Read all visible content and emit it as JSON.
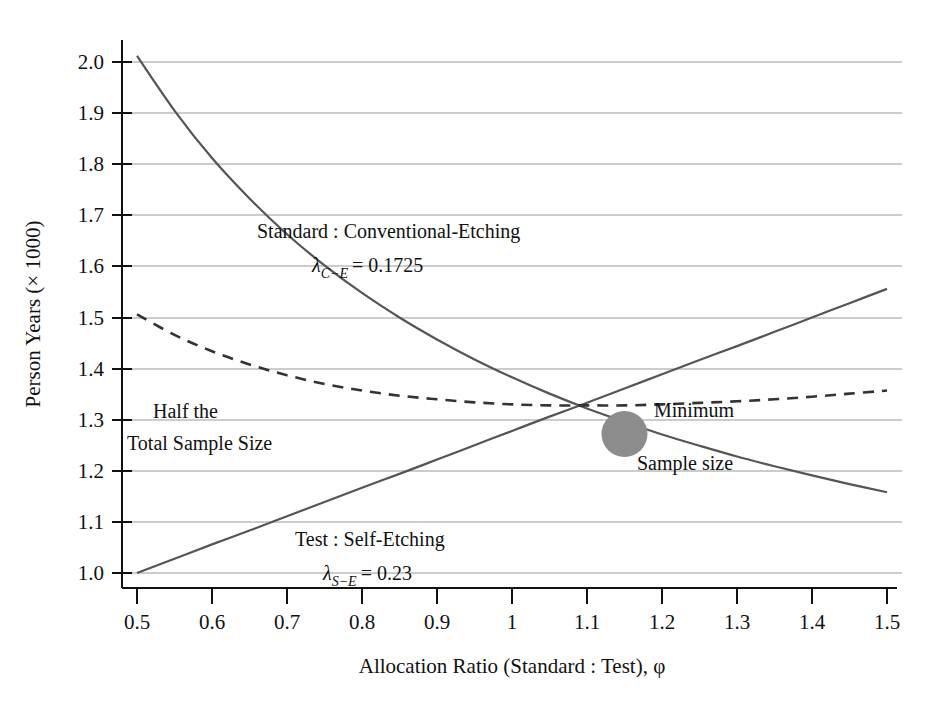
{
  "chart_data": {
    "type": "line",
    "title": "",
    "xlabel": "Allocation Ratio (Standard : Test), φ",
    "ylabel": "Person Years (× 1000)",
    "xlim": [
      0.5,
      1.5
    ],
    "ylim": [
      1.0,
      2.0
    ],
    "grid": true,
    "legend_position": "inline-annotations",
    "xticks": [
      "0.5",
      "0.6",
      "0.7",
      "0.8",
      "0.9",
      "1",
      "1.1",
      "1.2",
      "1.3",
      "1.4",
      "1.5"
    ],
    "xtick_values": [
      0.5,
      0.6,
      0.7,
      0.8,
      0.9,
      1.0,
      1.1,
      1.2,
      1.3,
      1.4,
      1.5
    ],
    "yticks": [
      "1.0",
      "1.1",
      "1.2",
      "1.3",
      "1.4",
      "1.5",
      "1.6",
      "1.7",
      "1.8",
      "1.9",
      "2.0"
    ],
    "ytick_values": [
      1.0,
      1.1,
      1.2,
      1.3,
      1.4,
      1.5,
      1.6,
      1.7,
      1.8,
      1.9,
      2.0
    ],
    "x": [
      0.5,
      0.55,
      0.6,
      0.65,
      0.7,
      0.75,
      0.8,
      0.85,
      0.9,
      0.95,
      1.0,
      1.05,
      1.1,
      1.15,
      1.2,
      1.25,
      1.3,
      1.35,
      1.4,
      1.45,
      1.5
    ],
    "series": [
      {
        "name": "Standard : Conventional-Etching",
        "style": "solid",
        "color": "#555555",
        "annotation_line1": "Standard : Conventional-Etching",
        "annotation_line2_lambda": "λ",
        "annotation_line2_sub": "C−E",
        "annotation_line2_value": "= 0.1725",
        "values": [
          2.012,
          1.905,
          1.812,
          1.733,
          1.663,
          1.602,
          1.548,
          1.5,
          1.457,
          1.418,
          1.383,
          1.351,
          1.322,
          1.296,
          1.271,
          1.249,
          1.228,
          1.209,
          1.191,
          1.174,
          1.158
        ]
      },
      {
        "name": "Test : Self-Etching",
        "style": "solid",
        "color": "#555555",
        "annotation_line1": "Test : Self-Etching",
        "annotation_line2_lambda": "λ",
        "annotation_line2_sub": "S−E",
        "annotation_line2_value": "= 0.23",
        "values": [
          1.0,
          1.028,
          1.056,
          1.083,
          1.111,
          1.139,
          1.167,
          1.194,
          1.222,
          1.25,
          1.278,
          1.306,
          1.333,
          1.361,
          1.389,
          1.417,
          1.444,
          1.472,
          1.5,
          1.528,
          1.556
        ]
      },
      {
        "name": "Half the Total Sample Size",
        "style": "dashed",
        "color": "#333333",
        "annotation_line1": "Half the",
        "annotation_line2": "Total Sample Size",
        "values": [
          1.506,
          1.466,
          1.434,
          1.408,
          1.387,
          1.37,
          1.357,
          1.347,
          1.34,
          1.334,
          1.33,
          1.328,
          1.328,
          1.328,
          1.33,
          1.333,
          1.336,
          1.34,
          1.345,
          1.351,
          1.357
        ]
      }
    ],
    "markers": [
      {
        "name": "Minimum Sample size",
        "label_line1": "Minimum",
        "label_line2": "Sample size",
        "x": 1.15,
        "y": 1.272,
        "color": "#8c8c8c",
        "shape": "circle"
      }
    ]
  }
}
